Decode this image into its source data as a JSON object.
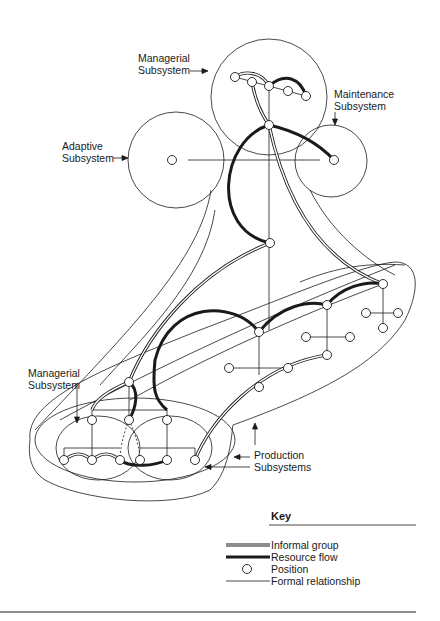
{
  "labels": {
    "managerial_top": [
      "Managerial",
      "Subsystem"
    ],
    "maintenance": [
      "Maintenance",
      "Subsystem"
    ],
    "adaptive": [
      "Adaptive",
      "Subsystem"
    ],
    "managerial_bottom": [
      "Managerial",
      "Subsystem"
    ],
    "production": [
      "Production",
      "Subsystems"
    ]
  },
  "key": {
    "title": "Key",
    "items": [
      {
        "symbol": "double-line",
        "label": "Informal group"
      },
      {
        "symbol": "thick-line",
        "label": "Resource flow"
      },
      {
        "symbol": "circle",
        "label": "Position"
      },
      {
        "symbol": "thin-line",
        "label": "Formal relationship"
      }
    ]
  },
  "colors": {
    "ink": "#1a1a1a",
    "background": "#ffffff"
  }
}
